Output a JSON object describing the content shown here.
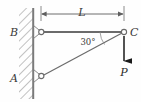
{
  "diagram": {
    "type": "statics-truss-free-body-diagram",
    "title": "",
    "colors": {
      "line": "#6b6b6b",
      "wall": "#7a7a7a",
      "hatch": "#8f8f8f",
      "text": "#3a3a3a",
      "force": "#1a1a1a",
      "background": "#fefefe"
    },
    "labels": {
      "joint_a": "A",
      "joint_b": "B",
      "joint_c": "C",
      "angle": "30°",
      "dimension_length": "L",
      "force": "P"
    },
    "geometry": {
      "wall_x": 33,
      "wall_top": 8,
      "wall_bottom": 99,
      "joint_b": {
        "x": 41,
        "y": 32
      },
      "joint_a": {
        "x": 41,
        "y": 76
      },
      "joint_c": {
        "x": 124,
        "y": 32
      },
      "force_arrow": {
        "x": 124,
        "y_start": 36,
        "y_end": 63
      },
      "dimension_line": {
        "y": 14,
        "x_start": 41,
        "x_end": 124
      },
      "angle_value_deg": 30
    },
    "members": [
      {
        "name": "BC",
        "from": "B",
        "to": "C",
        "orientation": "horizontal"
      },
      {
        "name": "AC",
        "from": "A",
        "to": "C",
        "orientation": "diagonal"
      }
    ],
    "supports": [
      {
        "at": "B",
        "kind": "pin-support"
      },
      {
        "at": "A",
        "kind": "pin-support"
      }
    ],
    "loads": [
      {
        "at": "C",
        "label": "P",
        "direction": "down"
      }
    ]
  }
}
